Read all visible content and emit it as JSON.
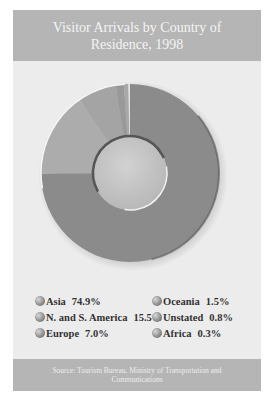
{
  "header": {
    "title": "Visitor Arrivals by Country of Residence, 1998"
  },
  "legend": [
    {
      "label": "Asia",
      "value": "74.9%"
    },
    {
      "label": "N. and S. America",
      "value": "15.5%"
    },
    {
      "label": "Europe",
      "value": "7.0%"
    },
    {
      "label": "Oceania",
      "value": "1.5%"
    },
    {
      "label": "Unstated",
      "value": "0.8%"
    },
    {
      "label": "Africa",
      "value": "0.3%"
    }
  ],
  "footer": {
    "source": "Source: Tourism Bureau, Ministry of Transportation and Communications"
  },
  "colors": {
    "header_bg": "#b5b5b5",
    "panel_bg": "#ececec",
    "asia": "#8b8b8b",
    "americas": "#acacac",
    "europe": "#a4a4a4",
    "oceania": "#999999",
    "unstated": "#a8a8a8",
    "africa": "#e0e0e0"
  },
  "chart_data": {
    "type": "pie",
    "subtype": "donut",
    "title": "Visitor Arrivals by Country of Residence, 1998",
    "categories": [
      "Asia",
      "N. and S. America",
      "Europe",
      "Oceania",
      "Unstated",
      "Africa"
    ],
    "values": [
      74.9,
      15.5,
      7.0,
      1.5,
      0.8,
      0.3
    ],
    "unit": "%",
    "start_angle": "12 o'clock, clockwise",
    "legend_position": "bottom, two columns",
    "source": "Source: Tourism Bureau, Ministry of Transportation and Communications"
  }
}
